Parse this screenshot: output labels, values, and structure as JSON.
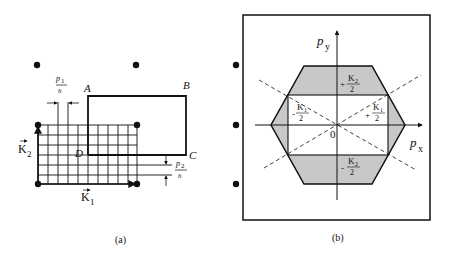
{
  "figure": {
    "panel_a": {
      "caption": "(a)",
      "vertex_labels": {
        "A": "A",
        "B": "B",
        "C": "C",
        "D": "D"
      },
      "p1_num": "p",
      "p1_sub": "1",
      "p1_den": "ħ",
      "p2_num": "p",
      "p2_sub": "2",
      "p2_den": "ħ",
      "k1": "K",
      "k1_sub": "1",
      "k2": "K",
      "k2_sub": "2"
    },
    "panel_b": {
      "caption": "(b)",
      "axis_y": "p",
      "axis_y_sub": "y",
      "axis_x": "p",
      "axis_x_sub": "x",
      "origin": "0",
      "top_label_sign": "+",
      "top_label_num": "K",
      "top_label_sub": "2",
      "top_label_den": "2",
      "bottom_label_sign": "-",
      "bottom_label_num": "K",
      "bottom_label_sub": "2",
      "bottom_label_den": "2",
      "left_label_sign": "-",
      "left_label_num": "K",
      "left_label_sub": "1",
      "left_label_den": "2",
      "right_label_sign": "+",
      "right_label_num": "K",
      "right_label_sub": "1",
      "right_label_den": "2"
    },
    "colors": {
      "ink": "#111111",
      "shade": "#c8c8c8",
      "background": "#ffffff"
    }
  }
}
